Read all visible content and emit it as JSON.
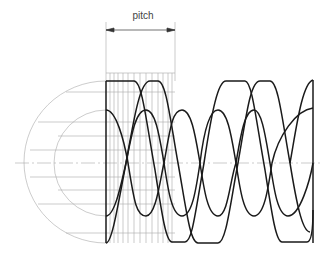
{
  "figure": {
    "type": "technical-drawing",
    "dimension_label": "pitch",
    "colors": {
      "line": "#222222",
      "construction": "#999999",
      "background": "#ffffff"
    }
  }
}
